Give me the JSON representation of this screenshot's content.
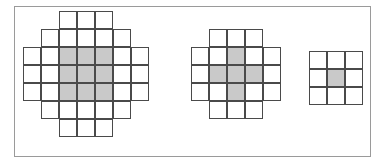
{
  "figure": {
    "background_color": "#ffffff",
    "frame_color": "#9a9a9a",
    "cell_border_color": "#4a4a4a",
    "fill_color": "#c9c9c9",
    "cell_size_px": 18,
    "shape_count": 3
  },
  "chart_data": {
    "type": "diagram",
    "shapes": [
      {
        "name": "large-disk",
        "label": "",
        "rows": 7,
        "cols": 7,
        "row_widths": [
          3,
          5,
          7,
          7,
          7,
          5,
          3
        ],
        "cell_count": 37,
        "filled_cell_count": 9,
        "outline_mask": [
          [
            0,
            0,
            1,
            1,
            1,
            0,
            0
          ],
          [
            0,
            1,
            1,
            1,
            1,
            1,
            0
          ],
          [
            1,
            1,
            1,
            1,
            1,
            1,
            1
          ],
          [
            1,
            1,
            1,
            1,
            1,
            1,
            1
          ],
          [
            1,
            1,
            1,
            1,
            1,
            1,
            1
          ],
          [
            0,
            1,
            1,
            1,
            1,
            1,
            0
          ],
          [
            0,
            0,
            1,
            1,
            1,
            0,
            0
          ]
        ],
        "fill_mask": [
          [
            0,
            0,
            0,
            0,
            0,
            0,
            0
          ],
          [
            0,
            0,
            0,
            0,
            0,
            0,
            0
          ],
          [
            0,
            0,
            1,
            1,
            1,
            0,
            0
          ],
          [
            0,
            0,
            1,
            1,
            1,
            0,
            0
          ],
          [
            0,
            0,
            1,
            1,
            1,
            0,
            0
          ],
          [
            0,
            0,
            0,
            0,
            0,
            0,
            0
          ],
          [
            0,
            0,
            0,
            0,
            0,
            0,
            0
          ]
        ],
        "origin_x": 22,
        "origin_y": 10
      },
      {
        "name": "medium-disk",
        "label": "",
        "rows": 5,
        "cols": 5,
        "row_widths": [
          3,
          5,
          5,
          5,
          3
        ],
        "cell_count": 21,
        "filled_cell_count": 5,
        "outline_mask": [
          [
            0,
            1,
            1,
            1,
            0
          ],
          [
            1,
            1,
            1,
            1,
            1
          ],
          [
            1,
            1,
            1,
            1,
            1
          ],
          [
            1,
            1,
            1,
            1,
            1
          ],
          [
            0,
            1,
            1,
            1,
            0
          ]
        ],
        "fill_mask": [
          [
            0,
            0,
            0,
            0,
            0
          ],
          [
            0,
            0,
            1,
            0,
            0
          ],
          [
            0,
            1,
            1,
            1,
            0
          ],
          [
            0,
            0,
            1,
            0,
            0
          ],
          [
            0,
            0,
            0,
            0,
            0
          ]
        ],
        "origin_x": 190,
        "origin_y": 28
      },
      {
        "name": "small-disk",
        "label": "",
        "rows": 3,
        "cols": 3,
        "row_widths": [
          3,
          3,
          3
        ],
        "cell_count": 9,
        "filled_cell_count": 1,
        "outline_mask": [
          [
            1,
            1,
            1
          ],
          [
            1,
            1,
            1
          ],
          [
            1,
            1,
            1
          ]
        ],
        "fill_mask": [
          [
            0,
            0,
            0
          ],
          [
            0,
            1,
            0
          ],
          [
            0,
            0,
            0
          ]
        ],
        "origin_x": 308,
        "origin_y": 50
      }
    ]
  }
}
